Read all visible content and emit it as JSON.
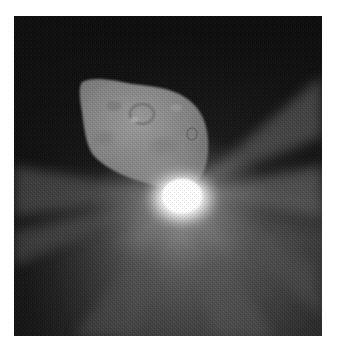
{
  "image": {
    "subject": "Comet nucleus with bright impact flash",
    "alt": "Grayscale space photograph of an irregular comet nucleus against a dark background, with a brilliant white impact flash at its lower right edge and rays of light scattering outward",
    "colors": {
      "background_page": "#ffffff",
      "space_dark": "#161616",
      "haze_gray": "#5a5a5a",
      "nucleus_gray": "#8a8a8a",
      "flash_white": "#ffffff"
    }
  }
}
